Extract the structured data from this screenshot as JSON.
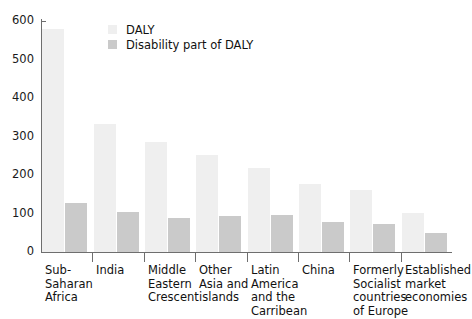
{
  "chart_data": {
    "type": "bar",
    "title": "",
    "subtitle": "",
    "xlabel": "",
    "ylabel": "",
    "ylim": [
      0,
      600
    ],
    "yticks": [
      0,
      100,
      200,
      300,
      400,
      500,
      600
    ],
    "ytick_labels": [
      "0",
      "100",
      "200",
      "300",
      "400",
      "500",
      "600"
    ],
    "grid": false,
    "legend_position": "top-left-inside",
    "categories": [
      "Sub-Saharan Africa",
      "India",
      "Middle Eastern Crescent",
      "Other Asia and islands",
      "Latin America and the Carribean",
      "China",
      "Formerly Socialist countries of Europe",
      "Established market economies"
    ],
    "category_lines": [
      [
        "Sub-",
        "Saharan",
        "Africa"
      ],
      [
        "India"
      ],
      [
        "Middle",
        "Eastern",
        "Crescent"
      ],
      [
        "Other",
        "Asia and",
        "islands"
      ],
      [
        "Latin",
        "America",
        "and the",
        "Carribean"
      ],
      [
        "China"
      ],
      [
        "Formerly",
        "Socialist",
        "countries",
        "of Europe"
      ],
      [
        "Established",
        "market",
        "economies"
      ]
    ],
    "series": [
      {
        "name": "DALY",
        "color": "#efefef",
        "values": [
          580,
          333,
          287,
          252,
          217,
          176,
          160,
          101
        ]
      },
      {
        "name": "Disability part of DALY",
        "color": "#cacaca",
        "values": [
          126,
          104,
          88,
          94,
          97,
          79,
          73,
          50
        ]
      }
    ]
  },
  "legend": {
    "items": [
      {
        "label": "DALY",
        "swatch": "daly"
      },
      {
        "label": "Disability part of DALY",
        "swatch": "disability"
      }
    ]
  },
  "colors": {
    "daly": "#efefef",
    "disability": "#cacaca",
    "axis": "#6e6e6e",
    "text": "#111111",
    "background": "#ffffff"
  }
}
